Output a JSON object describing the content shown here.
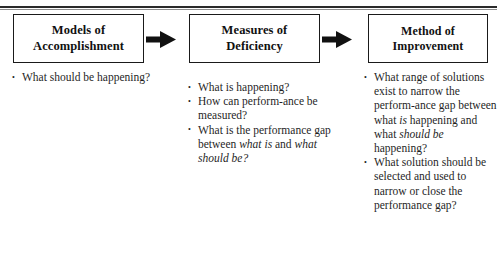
{
  "diagram": {
    "type": "three-stage-flow",
    "stages": [
      {
        "id": "models-of-accomplishment",
        "title_line1": "Models of",
        "title_line2": "Accomplishment",
        "bullets": [
          [
            {
              "text": "What should be happening?",
              "style": "normal"
            }
          ]
        ]
      },
      {
        "id": "measures-of-deficiency",
        "title_line1": "Measures of",
        "title_line2": "Deficiency",
        "bullets": [
          [
            {
              "text": "What is happening?",
              "style": "normal"
            }
          ],
          [
            {
              "text": "How can perform-­ance be measured?",
              "style": "normal"
            }
          ],
          [
            {
              "text": "What is the performance gap between ",
              "style": "normal"
            },
            {
              "text": "what is",
              "style": "italic"
            },
            {
              "text": " and ",
              "style": "normal"
            },
            {
              "text": "what should be?",
              "style": "italic"
            }
          ]
        ]
      },
      {
        "id": "method-of-improvement",
        "title_line1": "Method of",
        "title_line2": "Improvement",
        "bullets": [
          [
            {
              "text": "What range of solutions exist to narrow the perform-­ance gap between what ",
              "style": "normal"
            },
            {
              "text": "is",
              "style": "italic"
            },
            {
              "text": " happening and what ",
              "style": "normal"
            },
            {
              "text": "should be",
              "style": "italic"
            },
            {
              "text": " happening?",
              "style": "normal"
            }
          ],
          [
            {
              "text": "What solution should be selected and used to narrow or close the performance gap?",
              "style": "normal"
            }
          ]
        ]
      }
    ],
    "connectors": [
      {
        "id": "arrow-stage1-to-stage2",
        "shape": "block-arrow-right",
        "color": "#111111"
      },
      {
        "id": "arrow-stage2-to-stage3",
        "shape": "block-arrow-right",
        "color": "#111111"
      }
    ]
  },
  "colors": {
    "ink": "#1a1a1a",
    "rule": "#2b2b2b",
    "background": "#ffffff"
  }
}
